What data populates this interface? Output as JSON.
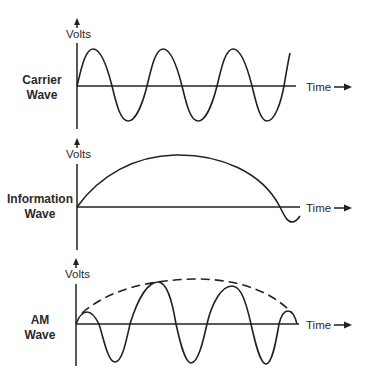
{
  "diagram": {
    "panels": [
      {
        "id": "carrier",
        "label_line1": "Carrier",
        "label_line2": "Wave",
        "y_axis_label": "Volts",
        "x_axis_label": "Time",
        "description": "Constant-amplitude high-frequency sine wave"
      },
      {
        "id": "information",
        "label_line1": "Information",
        "label_line2": "Wave",
        "y_axis_label": "Volts",
        "x_axis_label": "Time",
        "description": "Slow low-frequency wave (single broad arc)"
      },
      {
        "id": "am",
        "label_line1": "AM",
        "label_line2": "Wave",
        "y_axis_label": "Volts",
        "x_axis_label": "Time",
        "description": "Carrier whose amplitude follows the information wave; dashed envelope"
      }
    ],
    "colors": {
      "line": "#222222",
      "text": "#2a2a2a",
      "background": "#ffffff"
    }
  }
}
